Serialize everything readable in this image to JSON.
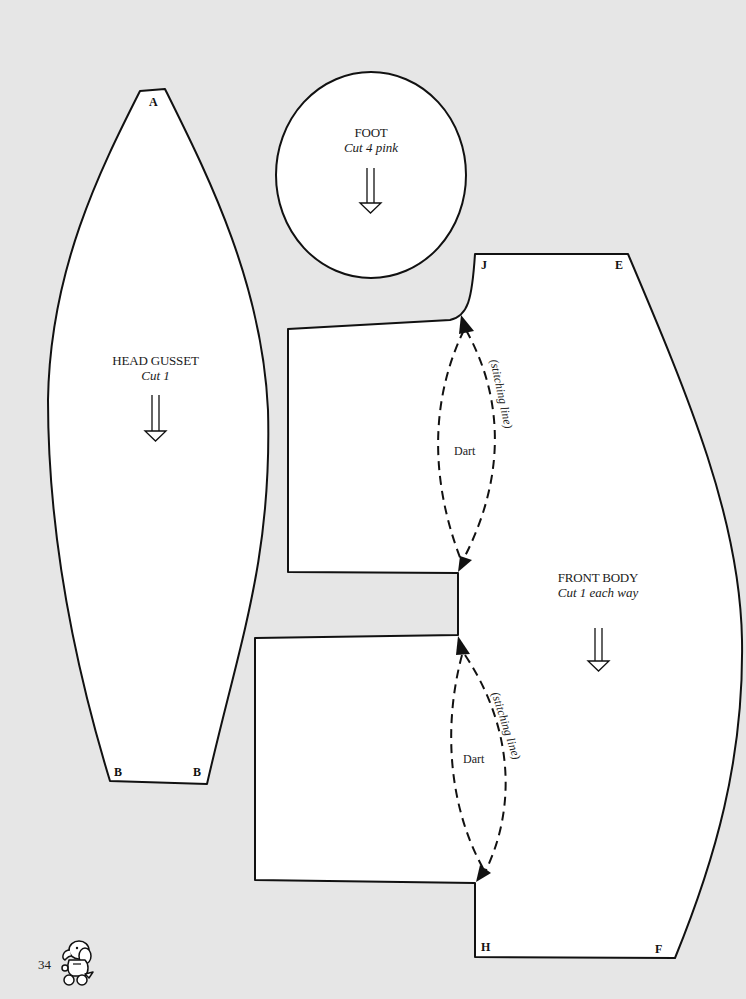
{
  "page": {
    "background_color": "#e6e6e6",
    "page_number": "34",
    "mascot_icon": "elephant-mascot-icon"
  },
  "pieces": {
    "head_gusset": {
      "title": "HEAD GUSSET",
      "cut": "Cut 1",
      "corners": {
        "top": "A",
        "bottom_left": "B",
        "bottom_right": "B"
      },
      "grain_icon": "grainline-arrow-down-icon"
    },
    "foot": {
      "title": "FOOT",
      "cut": "Cut 4 pink",
      "grain_icon": "grainline-arrow-down-icon"
    },
    "front_body": {
      "title": "FRONT BODY",
      "cut": "Cut 1 each way",
      "corners": {
        "top_left": "J",
        "top_right": "E",
        "bottom_left": "H",
        "bottom_right": "F"
      },
      "grain_icon": "grainline-arrow-down-icon",
      "darts": [
        {
          "label": "Dart",
          "stitch_label": "(stitching line)"
        },
        {
          "label": "Dart",
          "stitch_label": "(stitching line)"
        }
      ]
    }
  },
  "colors": {
    "paper": "#ffffff",
    "outline": "#111111",
    "background": "#e6e6e6"
  }
}
